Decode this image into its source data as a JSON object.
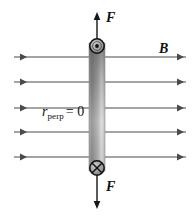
{
  "figure": {
    "background_color": "#ffffff",
    "width": 195,
    "height": 220
  },
  "labels": {
    "force_top": "F",
    "force_bottom": "F",
    "field": "B",
    "radius_symbol": "r",
    "radius_subscript": "perp",
    "radius_equals": "=",
    "radius_value": "0"
  },
  "icons": {
    "current_out_of_page": "circle-dot-icon",
    "current_into_page": "circle-cross-icon",
    "arrow_up": "arrow-up-icon",
    "arrow_down": "arrow-down-icon",
    "arrow_right": "arrow-right-icon"
  },
  "colors": {
    "line": "#4a4a4a",
    "label": "#121212",
    "bar_dark": "#6f6f6f",
    "bar_light": "#d8d8d8",
    "bar_edge": "#8a8a8a",
    "symbol_fill": "#9a9a9a",
    "symbol_stroke": "#111111"
  },
  "field_lines": {
    "count": 5,
    "y_positions": [
      57,
      82,
      108,
      132,
      157
    ],
    "x_start": 14,
    "x_end": 186,
    "direction": "right",
    "arrow_positions": [
      27,
      182
    ]
  },
  "bar": {
    "x": 89,
    "y": 43,
    "width": 16,
    "height": 128,
    "orientation": "vertical"
  },
  "force_arrows": {
    "top": {
      "x": 97,
      "y_start": 42,
      "y_end": 13
    },
    "bottom": {
      "x": 97,
      "y_start": 170,
      "y_end": 208
    }
  },
  "current_markers": {
    "top": {
      "cx": 97,
      "cy": 46,
      "r": 7,
      "type": "out-of-page"
    },
    "bottom": {
      "cx": 97,
      "cy": 168,
      "r": 7,
      "type": "into-page"
    }
  }
}
